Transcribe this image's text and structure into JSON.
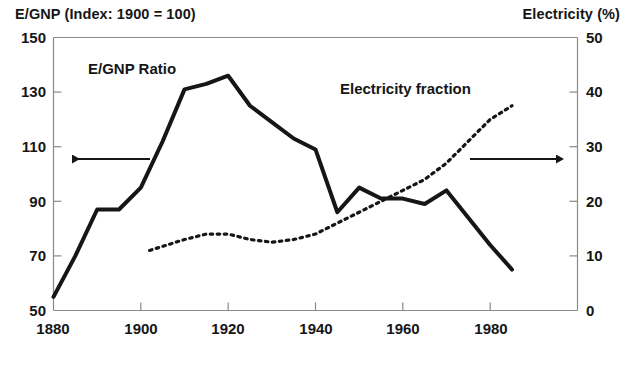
{
  "chart_data": {
    "type": "line",
    "title": "",
    "left_axis": {
      "label": "E/GNP (Index: 1900 = 100)",
      "ticks": [
        50,
        70,
        90,
        110,
        130,
        150
      ],
      "ylim": [
        50,
        150
      ]
    },
    "right_axis": {
      "label": "Electricity (%)",
      "ticks": [
        0,
        10,
        20,
        30,
        40,
        50
      ],
      "ylim": [
        0,
        50
      ]
    },
    "xaxis": {
      "label": "",
      "ticks": [
        1880,
        1900,
        1920,
        1940,
        1960,
        1980
      ],
      "xlim": [
        1880,
        2000
      ]
    },
    "grid": false,
    "legend_position": "inline-annotations",
    "series": [
      {
        "name": "E/GNP Ratio",
        "axis": "left",
        "style": "solid",
        "x": [
          1880,
          1885,
          1890,
          1895,
          1900,
          1905,
          1910,
          1915,
          1920,
          1925,
          1930,
          1935,
          1940,
          1945,
          1950,
          1955,
          1960,
          1965,
          1970,
          1975,
          1980,
          1985
        ],
        "values": [
          55,
          70,
          87,
          87,
          95,
          112,
          131,
          133,
          136,
          125,
          119,
          113,
          109,
          86,
          95,
          91,
          91,
          89,
          94,
          84,
          74,
          65
        ]
      },
      {
        "name": "Electricity fraction",
        "axis": "right",
        "style": "dotted",
        "x": [
          1902,
          1910,
          1915,
          1920,
          1925,
          1930,
          1935,
          1940,
          1945,
          1950,
          1955,
          1960,
          1965,
          1970,
          1975,
          1980,
          1985
        ],
        "values": [
          11,
          13,
          14,
          14,
          13,
          12.5,
          13,
          14,
          16,
          18,
          20,
          22,
          24,
          27,
          31,
          35,
          37.5
        ]
      }
    ],
    "annotations": [
      {
        "name": "E/GNP Ratio",
        "text": "E/GNP Ratio"
      },
      {
        "name": "Electricity fraction",
        "text": "Electricity fraction"
      },
      {
        "name": "left-arrow",
        "text": "←"
      },
      {
        "name": "right-arrow",
        "text": "→"
      }
    ]
  },
  "left_axis_title": "E/GNP (Index: 1900 = 100)",
  "right_axis_title": "Electricity (%)",
  "left_ticks": [
    "150",
    "130",
    "110",
    "90",
    "70",
    "50"
  ],
  "right_ticks": [
    "50",
    "40",
    "30",
    "20",
    "10",
    "0"
  ],
  "x_ticks": [
    "1880",
    "1900",
    "1920",
    "1940",
    "1960",
    "1980"
  ],
  "series_labels": {
    "egnp": "E/GNP Ratio",
    "electricity": "Electricity fraction"
  },
  "colors": {
    "ink": "#161616",
    "axis": "#7d7d7d",
    "background": "#ffffff"
  }
}
